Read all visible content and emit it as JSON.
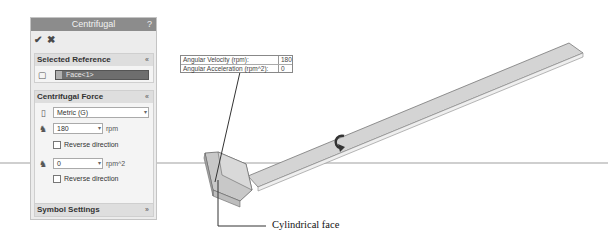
{
  "panel": {
    "title": "Centrifugal",
    "help_label": "?",
    "ok_icon": "checkmark-icon",
    "cancel_icon": "x-icon",
    "selected_reference": {
      "header": "Selected Reference",
      "collapse_glyph": "«",
      "face_value": "Face<1>"
    },
    "centrifugal_force": {
      "header": "Centrifugal Force",
      "collapse_glyph": "«",
      "unit_system": "Metric (G)",
      "angular_velocity": "180",
      "angular_velocity_unit": "rpm",
      "reverse_direction_1": "Reverse direction",
      "angular_acceleration": "0",
      "angular_acceleration_unit": "rpm^2",
      "reverse_direction_2": "Reverse direction"
    },
    "symbol_settings": {
      "header": "Symbol Settings",
      "expand_glyph": "»"
    }
  },
  "callout": {
    "rows": [
      {
        "label": "Angular Velocity (rpm):",
        "value": "180"
      },
      {
        "label": "Angular Acceleration (rpm^2):",
        "value": "0"
      }
    ]
  },
  "annotation": {
    "caption": "Cylindrical face"
  }
}
